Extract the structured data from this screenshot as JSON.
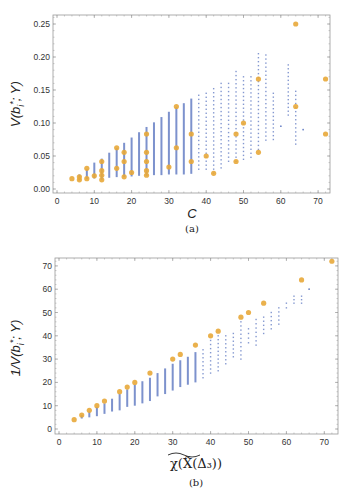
{
  "figure": {
    "caption_a": "(a)",
    "caption_b": "(b)",
    "colors": {
      "bars": "#6f86c8",
      "points": "#e8a93a",
      "frame": "#9a9a9a"
    }
  },
  "chart_data": [
    {
      "id": "a",
      "type": "scatter",
      "title": "",
      "xlabel": "C",
      "ylabel": "V(b_i^*; Y)",
      "xlim": [
        0,
        73
      ],
      "ylim": [
        0,
        0.26
      ],
      "xticks": [
        0,
        10,
        20,
        30,
        40,
        50,
        60,
        70
      ],
      "yticks": [
        "0.00",
        "0.05",
        "0.10",
        "0.15",
        "0.20",
        "0.25"
      ],
      "grid": false,
      "series": [
        {
          "name": "distribution (blue)",
          "kind": "vertical-range",
          "ranges": [
            {
              "x": 6,
              "lo": 0.013,
              "hi": 0.022
            },
            {
              "x": 8,
              "lo": 0.015,
              "hi": 0.03
            },
            {
              "x": 10,
              "lo": 0.016,
              "hi": 0.04
            },
            {
              "x": 12,
              "lo": 0.014,
              "hi": 0.046
            },
            {
              "x": 14,
              "lo": 0.017,
              "hi": 0.055
            },
            {
              "x": 16,
              "lo": 0.018,
              "hi": 0.062
            },
            {
              "x": 18,
              "lo": 0.018,
              "hi": 0.07
            },
            {
              "x": 20,
              "lo": 0.019,
              "hi": 0.078
            },
            {
              "x": 22,
              "lo": 0.02,
              "hi": 0.086
            },
            {
              "x": 24,
              "lo": 0.02,
              "hi": 0.094
            },
            {
              "x": 26,
              "lo": 0.021,
              "hi": 0.101
            },
            {
              "x": 28,
              "lo": 0.021,
              "hi": 0.109
            },
            {
              "x": 30,
              "lo": 0.022,
              "hi": 0.117
            },
            {
              "x": 32,
              "lo": 0.022,
              "hi": 0.124
            },
            {
              "x": 34,
              "lo": 0.022,
              "hi": 0.13
            },
            {
              "x": 36,
              "lo": 0.023,
              "hi": 0.137
            },
            {
              "x": 38,
              "lo": 0.03,
              "hi": 0.142
            },
            {
              "x": 40,
              "lo": 0.03,
              "hi": 0.145
            },
            {
              "x": 42,
              "lo": 0.024,
              "hi": 0.152
            },
            {
              "x": 44,
              "lo": 0.032,
              "hi": 0.16
            },
            {
              "x": 46,
              "lo": 0.042,
              "hi": 0.16
            },
            {
              "x": 48,
              "lo": 0.042,
              "hi": 0.178
            },
            {
              "x": 50,
              "lo": 0.045,
              "hi": 0.17
            },
            {
              "x": 52,
              "lo": 0.048,
              "hi": 0.17
            },
            {
              "x": 54,
              "lo": 0.06,
              "hi": 0.205
            },
            {
              "x": 56,
              "lo": 0.074,
              "hi": 0.203
            },
            {
              "x": 58,
              "lo": 0.075,
              "hi": 0.145
            },
            {
              "x": 60,
              "lo": 0.095,
              "hi": 0.095
            },
            {
              "x": 62,
              "lo": 0.112,
              "hi": 0.188
            },
            {
              "x": 64,
              "lo": 0.068,
              "hi": 0.148
            },
            {
              "x": 66,
              "lo": 0.09,
              "hi": 0.09
            }
          ]
        },
        {
          "name": "highlighted (orange)",
          "kind": "points",
          "points": [
            [
              4,
              0.0156
            ],
            [
              6,
              0.0139
            ],
            [
              6,
              0.0185
            ],
            [
              8,
              0.0313
            ],
            [
              8,
              0.0156
            ],
            [
              10,
              0.02
            ],
            [
              12,
              0.0417
            ],
            [
              12,
              0.0278
            ],
            [
              12,
              0.0208
            ],
            [
              12,
              0.0139
            ],
            [
              16,
              0.0625
            ],
            [
              16,
              0.0313
            ],
            [
              18,
              0.0556
            ],
            [
              18,
              0.0417
            ],
            [
              18,
              0.0185
            ],
            [
              20,
              0.025
            ],
            [
              24,
              0.0833
            ],
            [
              24,
              0.0556
            ],
            [
              24,
              0.0417
            ],
            [
              24,
              0.0278
            ],
            [
              24,
              0.0208
            ],
            [
              30,
              0.0333
            ],
            [
              32,
              0.125
            ],
            [
              32,
              0.0625
            ],
            [
              36,
              0.0833
            ],
            [
              36,
              0.0417
            ],
            [
              40,
              0.05
            ],
            [
              42,
              0.0238
            ],
            [
              48,
              0.0833
            ],
            [
              48,
              0.0417
            ],
            [
              50,
              0.1
            ],
            [
              54,
              0.1667
            ],
            [
              54,
              0.0556
            ],
            [
              64,
              0.25
            ],
            [
              64,
              0.125
            ],
            [
              72,
              0.1667
            ],
            [
              72,
              0.0833
            ]
          ]
        }
      ]
    },
    {
      "id": "b",
      "type": "scatter",
      "title": "",
      "xlabel": "χ(X̃(Δ₃))",
      "ylabel": "1/V(b_i^*; Y)",
      "xlim": [
        0,
        73
      ],
      "ylim": [
        -1,
        74
      ],
      "xticks": [
        0,
        10,
        20,
        30,
        40,
        50,
        60,
        70
      ],
      "yticks": [
        "0",
        "10",
        "20",
        "30",
        "40",
        "50",
        "60",
        "70"
      ],
      "grid": false,
      "series": [
        {
          "name": "distribution (blue)",
          "kind": "vertical-range",
          "ranges": [
            {
              "x": 6,
              "lo": 4.5,
              "hi": 6
            },
            {
              "x": 8,
              "lo": 5,
              "hi": 7.5
            },
            {
              "x": 10,
              "lo": 5.5,
              "hi": 9.5
            },
            {
              "x": 12,
              "lo": 6.5,
              "hi": 11
            },
            {
              "x": 14,
              "lo": 7.5,
              "hi": 13
            },
            {
              "x": 16,
              "lo": 8,
              "hi": 15
            },
            {
              "x": 18,
              "lo": 9.5,
              "hi": 17
            },
            {
              "x": 20,
              "lo": 10,
              "hi": 19
            },
            {
              "x": 22,
              "lo": 11,
              "hi": 20.5
            },
            {
              "x": 24,
              "lo": 12,
              "hi": 22
            },
            {
              "x": 26,
              "lo": 14,
              "hi": 24
            },
            {
              "x": 28,
              "lo": 15,
              "hi": 26
            },
            {
              "x": 30,
              "lo": 16.5,
              "hi": 28
            },
            {
              "x": 32,
              "lo": 18,
              "hi": 29.5
            },
            {
              "x": 34,
              "lo": 19,
              "hi": 31
            },
            {
              "x": 36,
              "lo": 20,
              "hi": 33
            },
            {
              "x": 38,
              "lo": 22,
              "hi": 34
            },
            {
              "x": 40,
              "lo": 24,
              "hi": 38
            },
            {
              "x": 42,
              "lo": 25,
              "hi": 40
            },
            {
              "x": 44,
              "lo": 28,
              "hi": 40
            },
            {
              "x": 46,
              "lo": 31,
              "hi": 41
            },
            {
              "x": 48,
              "lo": 30,
              "hi": 46
            },
            {
              "x": 50,
              "lo": 37,
              "hi": 43
            },
            {
              "x": 52,
              "lo": 36,
              "hi": 47
            },
            {
              "x": 54,
              "lo": 41,
              "hi": 48
            },
            {
              "x": 56,
              "lo": 43,
              "hi": 50
            },
            {
              "x": 58,
              "lo": 45,
              "hi": 52
            },
            {
              "x": 60,
              "lo": 52,
              "hi": 54
            },
            {
              "x": 62,
              "lo": 54,
              "hi": 57
            },
            {
              "x": 64,
              "lo": 54,
              "hi": 57
            },
            {
              "x": 66,
              "lo": 60,
              "hi": 60
            }
          ]
        },
        {
          "name": "highlighted (orange)",
          "kind": "points",
          "points": [
            [
              4,
              4
            ],
            [
              6,
              6
            ],
            [
              8,
              8
            ],
            [
              10,
              10
            ],
            [
              12,
              12
            ],
            [
              16,
              16
            ],
            [
              18,
              18
            ],
            [
              20,
              20
            ],
            [
              24,
              24
            ],
            [
              30,
              30
            ],
            [
              32,
              32
            ],
            [
              36,
              36
            ],
            [
              40,
              40
            ],
            [
              42,
              42
            ],
            [
              48,
              48
            ],
            [
              50,
              50
            ],
            [
              54,
              54
            ],
            [
              64,
              64
            ],
            [
              72,
              72
            ]
          ]
        }
      ]
    }
  ]
}
